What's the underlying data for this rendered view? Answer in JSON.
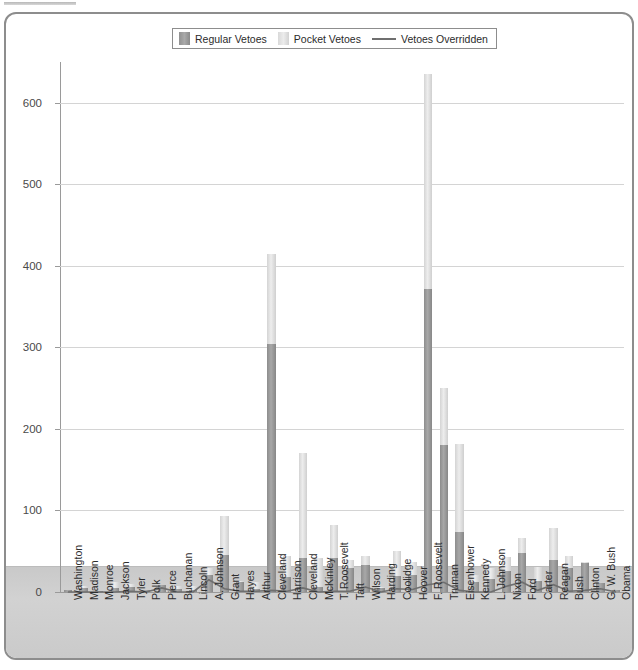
{
  "legend": {
    "items": [
      {
        "label": "Regular Vetoes",
        "kind": "swatch-regular",
        "color": "#9a9a9a"
      },
      {
        "label": "Pocket Vetoes",
        "kind": "swatch-pocket",
        "color": "#e0e0e0"
      },
      {
        "label": "Vetoes Overridden",
        "kind": "line",
        "color": "#6f6f6f"
      }
    ]
  },
  "chart_data": {
    "type": "bar",
    "title": "",
    "subtitle": "",
    "xlabel": "",
    "ylabel": "",
    "ylim": [
      0,
      650
    ],
    "yticks": [
      0,
      100,
      200,
      300,
      400,
      500,
      600
    ],
    "ytick_labels": [
      "0",
      "100",
      "200",
      "300",
      "400",
      "500",
      "600"
    ],
    "grid": true,
    "stacked": true,
    "legend_position": "top-center",
    "categories": [
      "Washington",
      "Madison",
      "Monroe",
      "Jackson",
      "Tyler",
      "Polk",
      "Pierce",
      "Buchanan",
      "Lincoln",
      "A. Johnson",
      "Grant",
      "Hayes",
      "Arthur",
      "Cleveland",
      "Harrison",
      "Cleveland",
      "McKinley",
      "T. Roosevelt",
      "Taft",
      "Wilson",
      "Harding",
      "Coolidge",
      "Hoover",
      "F. Roosevelt",
      "Truman",
      "Eisenhower",
      "Kennedy",
      "L. Johnson",
      "Nixon",
      "Ford",
      "Carter",
      "Reagan",
      "Bush",
      "Clinton",
      "G. W. Bush",
      "Obama"
    ],
    "series": [
      {
        "name": "Regular Vetoes",
        "color": "#9a9a9a",
        "values": [
          2,
          5,
          1,
          5,
          6,
          2,
          9,
          4,
          2,
          21,
          45,
          12,
          4,
          304,
          19,
          42,
          6,
          42,
          30,
          33,
          5,
          20,
          21,
          372,
          180,
          73,
          12,
          16,
          26,
          48,
          13,
          39,
          29,
          36,
          11,
          3
        ]
      },
      {
        "name": "Pocket Vetoes",
        "color": "#e0e0e0",
        "values": [
          0,
          2,
          0,
          7,
          4,
          1,
          0,
          3,
          5,
          8,
          48,
          1,
          8,
          110,
          25,
          128,
          36,
          40,
          9,
          11,
          1,
          30,
          16,
          263,
          70,
          108,
          9,
          14,
          17,
          18,
          18,
          39,
          15,
          1,
          0,
          0
        ]
      },
      {
        "name": "Vetoes Overridden",
        "type": "line",
        "color": "#6f6f6f",
        "values": [
          0,
          0,
          0,
          0,
          1,
          0,
          5,
          0,
          0,
          15,
          4,
          1,
          1,
          2,
          1,
          5,
          0,
          1,
          1,
          6,
          0,
          4,
          3,
          9,
          12,
          2,
          0,
          0,
          7,
          12,
          2,
          9,
          1,
          2,
          4,
          0
        ]
      }
    ]
  }
}
